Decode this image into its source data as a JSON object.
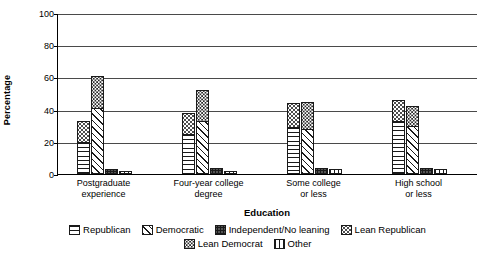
{
  "chart_data": {
    "type": "bar",
    "title": "",
    "xlabel": "Education",
    "ylabel": "Percentage",
    "ylim": [
      0,
      100
    ],
    "yticks": [
      0,
      20,
      40,
      60,
      80,
      100
    ],
    "grid": true,
    "stacked_groups": true,
    "legend_position": "bottom",
    "categories": [
      "Postgraduate experience",
      "Four-year college degree",
      "Some college or less",
      "High school or less"
    ],
    "series": [
      {
        "name": "Republican",
        "pattern": "horizontal-lines",
        "values": [
          20,
          25,
          29,
          33
        ]
      },
      {
        "name": "Lean Republican",
        "pattern": "light-dots",
        "values": [
          13,
          13,
          15,
          13
        ]
      },
      {
        "name": "Democratic",
        "pattern": "diagonal-hatch",
        "values": [
          41,
          33,
          28,
          30
        ]
      },
      {
        "name": "Lean Democrat",
        "pattern": "medium-dots",
        "values": [
          20,
          19,
          17,
          12
        ]
      },
      {
        "name": "Independent/No leaning",
        "pattern": "dense-dots",
        "values": [
          3,
          4,
          4,
          4
        ]
      },
      {
        "name": "Other",
        "pattern": "vertical-lines",
        "values": [
          2,
          2,
          3,
          3
        ]
      }
    ],
    "bar_totals": {
      "republican_stack": [
        33,
        38,
        44,
        46
      ],
      "democratic_stack": [
        61,
        52,
        45,
        42
      ]
    }
  },
  "legend": {
    "row1": [
      {
        "label": "Republican",
        "icon": "swatch-horizontal-lines"
      },
      {
        "label": "Democratic",
        "icon": "swatch-diagonal-hatch"
      },
      {
        "label": "Independent/No leaning",
        "icon": "swatch-dense-dots"
      },
      {
        "label": "Lean Republican",
        "icon": "swatch-light-dots"
      }
    ],
    "row2": [
      {
        "label": "Lean Democrat",
        "icon": "swatch-medium-dots"
      },
      {
        "label": "Other",
        "icon": "swatch-vertical-lines"
      }
    ]
  }
}
